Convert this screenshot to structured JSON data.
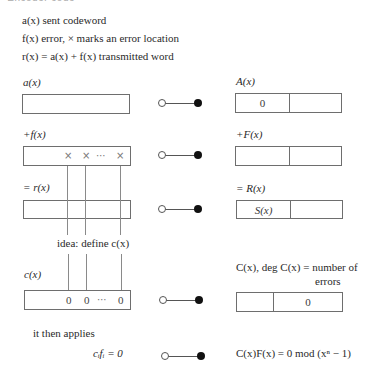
{
  "heading_clipped": "▪ Encoder code",
  "legend": {
    "line1": "a(x) sent codeword",
    "line2": "f(x) error, × marks an error location",
    "line3": "r(x) = a(x) + f(x) transmitted word"
  },
  "rows": [
    {
      "left_label": "a(x)",
      "right_label": "A(x)",
      "left_cells": [],
      "right_cells": [
        "0",
        ""
      ]
    },
    {
      "left_label": "+f(x)",
      "right_label": "+F(x)",
      "left_marks": [
        "×",
        "×",
        "⋯",
        "×"
      ],
      "right_cells": [
        "",
        ""
      ]
    },
    {
      "left_label": "= r(x)",
      "right_label": "= R(x)",
      "right_cells": [
        "S(x)",
        ""
      ]
    },
    {
      "left_label": "c(x)",
      "right_label_line1": "C(x),  deg C(x) = number of",
      "right_label_line2": "errors",
      "left_marks": [
        "0",
        "0",
        "⋯",
        "0"
      ],
      "right_cells": [
        "",
        "0"
      ]
    }
  ],
  "idea_text": "idea: define c(x)",
  "applies_text": "it then applies",
  "bottom": {
    "left_eq": "cᵢfᵢ = 0",
    "right_eq": "C(x)F(x) = 0 mod (xⁿ − 1)"
  },
  "connector_icon": "open-circle-to-filled-circle-map-icon"
}
